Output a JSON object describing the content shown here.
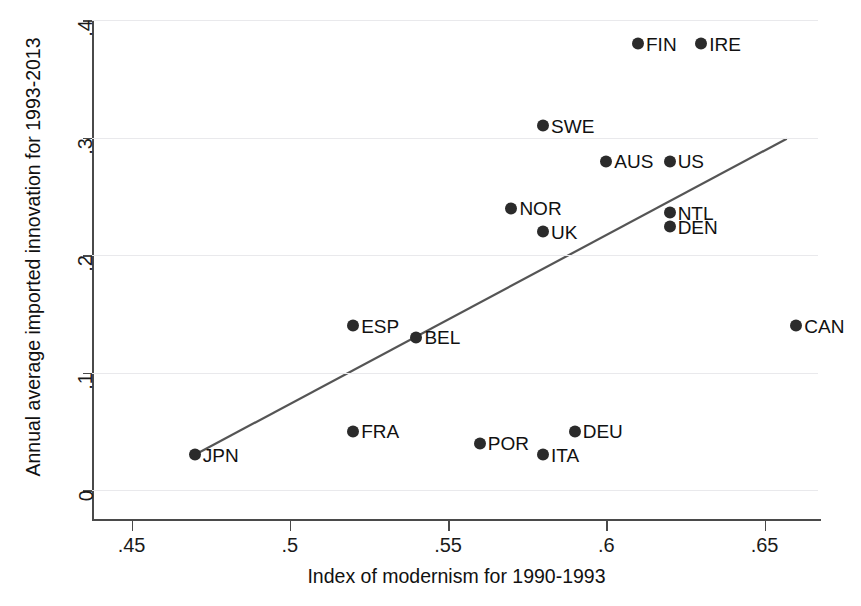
{
  "chart_data": {
    "type": "scatter",
    "title": "",
    "xlabel": "Index of modernism for 1990-1993",
    "ylabel": "Annual average imported innovation for 1993-2013",
    "xlim": [
      0.4375,
      0.6675
    ],
    "ylim": [
      0,
      0.4
    ],
    "xticks": [
      0.45,
      0.5,
      0.55,
      0.6,
      0.65
    ],
    "xtick_labels": [
      ".45",
      ".5",
      ".55",
      ".6",
      ".65"
    ],
    "yticks": [
      0,
      0.1,
      0.2,
      0.3,
      0.4
    ],
    "ytick_labels": [
      "0",
      ".1",
      ".2",
      ".3",
      ".4"
    ],
    "grid": "horizontal",
    "legend": "none",
    "marker_color": "#2b2b2b",
    "line_color": "#555555",
    "grid_color": "#e9e9ec",
    "axis_color": "#4a4a4a",
    "points": [
      {
        "label": "FIN",
        "x": 0.61,
        "y": 0.38,
        "label_side": "right"
      },
      {
        "label": "IRE",
        "x": 0.63,
        "y": 0.38,
        "label_side": "right"
      },
      {
        "label": "SWE",
        "x": 0.58,
        "y": 0.31,
        "label_side": "right"
      },
      {
        "label": "AUS",
        "x": 0.6,
        "y": 0.28,
        "label_side": "right"
      },
      {
        "label": "US",
        "x": 0.62,
        "y": 0.28,
        "label_side": "right"
      },
      {
        "label": "NOR",
        "x": 0.57,
        "y": 0.24,
        "label_side": "right"
      },
      {
        "label": "NTL",
        "x": 0.62,
        "y": 0.236,
        "label_side": "right"
      },
      {
        "label": "DEN",
        "x": 0.62,
        "y": 0.224,
        "label_side": "right"
      },
      {
        "label": "UK",
        "x": 0.58,
        "y": 0.22,
        "label_side": "right"
      },
      {
        "label": "CAN",
        "x": 0.66,
        "y": 0.14,
        "label_side": "right"
      },
      {
        "label": "ESP",
        "x": 0.52,
        "y": 0.14,
        "label_side": "right"
      },
      {
        "label": "BEL",
        "x": 0.54,
        "y": 0.13,
        "label_side": "right"
      },
      {
        "label": "DEU",
        "x": 0.59,
        "y": 0.05,
        "label_side": "right"
      },
      {
        "label": "FRA",
        "x": 0.52,
        "y": 0.05,
        "label_side": "right"
      },
      {
        "label": "POR",
        "x": 0.56,
        "y": 0.04,
        "label_side": "right"
      },
      {
        "label": "ITA",
        "x": 0.58,
        "y": 0.03,
        "label_side": "right"
      },
      {
        "label": "JPN",
        "x": 0.47,
        "y": 0.03,
        "label_side": "right"
      }
    ],
    "fit_line": {
      "type": "linear-fit",
      "x_start": 0.47,
      "y_start": 0.03,
      "x_end": 0.657,
      "y_end": 0.299
    }
  }
}
